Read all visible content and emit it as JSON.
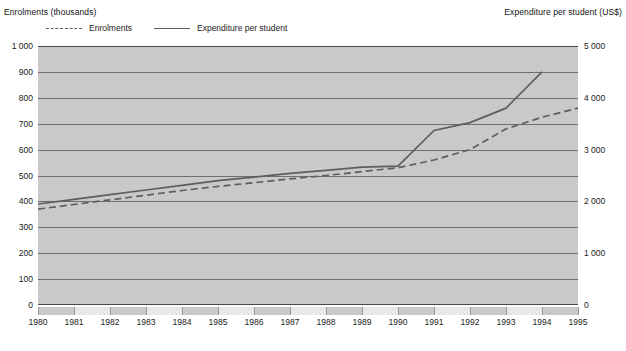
{
  "chart_data": {
    "type": "line",
    "title": "",
    "ylabel_left": "Enrolments (thousands)",
    "ylabel_right": "Expenditure per student (US$)",
    "xlabel": "",
    "grid": true,
    "legend_position": "top-left",
    "x": [
      1980,
      1981,
      1982,
      1983,
      1984,
      1985,
      1986,
      1987,
      1988,
      1989,
      1990,
      1991,
      1992,
      1993,
      1994,
      1995
    ],
    "categories": [
      "1980",
      "1981",
      "1982",
      "1983",
      "1984",
      "1985",
      "1986",
      "1987",
      "1988",
      "1989",
      "1990",
      "1991",
      "1992",
      "1993",
      "1994",
      "1995"
    ],
    "ylim_left": [
      0,
      1000
    ],
    "ylim_right": [
      0,
      5000
    ],
    "yticks_left": [
      "0",
      "100",
      "200",
      "300",
      "400",
      "500",
      "600",
      "700",
      "800",
      "900",
      "1 000"
    ],
    "yticks_right": [
      "0",
      "1 000",
      "2 000",
      "3 000",
      "4 000",
      "5 000"
    ],
    "ytick_values_left": [
      0,
      100,
      200,
      300,
      400,
      500,
      600,
      700,
      800,
      900,
      1000
    ],
    "ytick_values_right": [
      0,
      1000,
      2000,
      3000,
      4000,
      5000
    ],
    "series": [
      {
        "name": "Enrolments",
        "axis": "left",
        "style": "dashed",
        "color": "#5e5e5e",
        "values": [
          370,
          388,
          406,
          424,
          442,
          458,
          472,
          487,
          500,
          515,
          530,
          560,
          600,
          680,
          725,
          760
        ]
      },
      {
        "name": "Expenditure per student",
        "axis": "right",
        "style": "solid",
        "color": "#5e5e5e",
        "values": [
          1950,
          2040,
          2130,
          2220,
          2310,
          2400,
          2470,
          2540,
          2600,
          2660,
          2680,
          3370,
          3520,
          3800,
          4500,
          null
        ]
      }
    ]
  },
  "legend": {
    "items": [
      {
        "label": "Enrolments",
        "style": "dashed"
      },
      {
        "label": "Expenditure per student",
        "style": "solid"
      }
    ]
  },
  "colors": {
    "plot_background": "#c9c9c9",
    "gridline": "#6f6f6f",
    "frame": "#4a4a4a",
    "line": "#5e5e5e",
    "text": "#111111"
  }
}
